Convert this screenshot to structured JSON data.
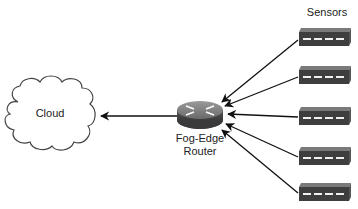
{
  "diagram": {
    "cloud": {
      "label": "Cloud",
      "icon": "cloud-icon"
    },
    "router": {
      "label_line1": "Fog-Edge",
      "label_line2": "Router",
      "icon": "router-icon"
    },
    "sensors": {
      "label": "Sensors",
      "items": [
        {
          "icon": "sensor-icon"
        },
        {
          "icon": "sensor-icon"
        },
        {
          "icon": "sensor-icon"
        },
        {
          "icon": "sensor-icon"
        },
        {
          "icon": "sensor-icon"
        }
      ]
    },
    "edges": [
      {
        "from": "router",
        "to": "cloud"
      },
      {
        "from": "sensor-1",
        "to": "router"
      },
      {
        "from": "sensor-2",
        "to": "router"
      },
      {
        "from": "sensor-3",
        "to": "router"
      },
      {
        "from": "sensor-4",
        "to": "router"
      },
      {
        "from": "sensor-5",
        "to": "router"
      }
    ],
    "colors": {
      "line": "#111111",
      "device_top": "#8a8a8a",
      "device_side": "#5a5a5a",
      "device_front": "#3e3e3e"
    }
  }
}
